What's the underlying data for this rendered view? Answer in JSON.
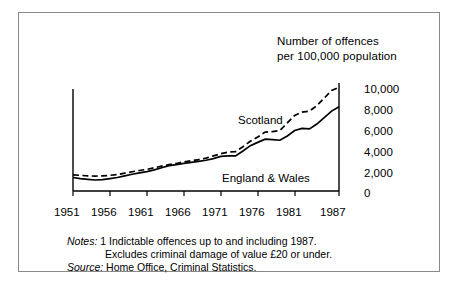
{
  "figure": {
    "axis_title_line1": "Number of offences",
    "axis_title_line2": "per 100,000 population"
  },
  "chart_data": {
    "type": "line",
    "title": "Number of offences per 100,000 population",
    "xlabel": "",
    "ylabel": "Number of offences per 100,000 population",
    "xlim": [
      1951,
      1987
    ],
    "ylim": [
      0,
      10000
    ],
    "yticks": [
      0,
      2000,
      4000,
      6000,
      8000,
      10000
    ],
    "ytick_labels": [
      "0",
      "2,000",
      "4,000",
      "6,000",
      "8,000",
      "10,000"
    ],
    "xticks": [
      1951,
      1956,
      1961,
      1966,
      1971,
      1976,
      1981,
      1987
    ],
    "xtick_labels": [
      "1951",
      "1956",
      "1961",
      "1966",
      "1971",
      "1976",
      "1981",
      "1987"
    ],
    "grid": false,
    "legend_position": "inline-annotation",
    "x": [
      1951,
      1952,
      1953,
      1954,
      1955,
      1956,
      1957,
      1958,
      1959,
      1960,
      1961,
      1962,
      1963,
      1964,
      1965,
      1966,
      1967,
      1968,
      1969,
      1970,
      1971,
      1972,
      1973,
      1974,
      1975,
      1976,
      1977,
      1978,
      1979,
      1980,
      1981,
      1982,
      1983,
      1984,
      1985,
      1986,
      1987
    ],
    "series": [
      {
        "name": "Scotland",
        "style": "dashed",
        "color": "#000000",
        "values": [
          1500,
          1450,
          1400,
          1380,
          1400,
          1450,
          1520,
          1650,
          1780,
          1900,
          2000,
          2150,
          2300,
          2450,
          2550,
          2700,
          2800,
          2900,
          3050,
          3250,
          3450,
          3600,
          3650,
          4100,
          4600,
          5000,
          5450,
          5500,
          5600,
          6300,
          7000,
          7300,
          7400,
          7900,
          8600,
          9300,
          9600
        ]
      },
      {
        "name": "England & Wales",
        "style": "solid",
        "color": "#000000",
        "values": [
          1250,
          1150,
          1080,
          1020,
          1050,
          1150,
          1250,
          1400,
          1550,
          1680,
          1800,
          1950,
          2150,
          2350,
          2450,
          2550,
          2650,
          2750,
          2850,
          3000,
          3200,
          3250,
          3250,
          3700,
          4200,
          4500,
          4800,
          4750,
          4700,
          5100,
          5600,
          5800,
          5750,
          6200,
          6800,
          7400,
          7800
        ]
      }
    ]
  },
  "notes": {
    "notes_key": "Notes:",
    "note_line1": "1 Indictable offences up to and including 1987.",
    "note_line2": "Excludes criminal damage of value £20 or under.",
    "source_key": "Source:",
    "source_text": "Home Office, Criminal Statistics."
  }
}
